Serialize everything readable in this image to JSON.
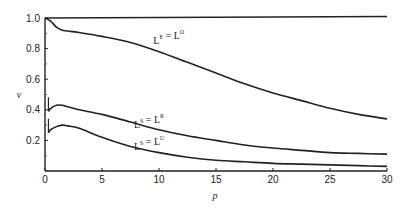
{
  "chart_data": {
    "type": "line",
    "title": "",
    "xlabel": "p",
    "ylabel": "v",
    "xlim": [
      0,
      30
    ],
    "ylim": [
      0,
      1.0
    ],
    "grid": false,
    "legend": "inline curve labels",
    "x_ticks": [
      0,
      5,
      10,
      15,
      20,
      25,
      30
    ],
    "x_tick_labels": [
      "0",
      "5",
      "10",
      "15",
      "20",
      "25",
      "30"
    ],
    "y_ticks": [
      0.2,
      0.4,
      0.6,
      0.8,
      1.0
    ],
    "y_tick_labels": [
      "0.2",
      "0.4",
      "0.6",
      "0.8",
      "1.0"
    ],
    "series": [
      {
        "name": "v = 1.0 (upper bound)",
        "label": "",
        "x": [
          0,
          30
        ],
        "values": [
          1.0,
          1.01
        ]
      },
      {
        "name": "L^E = L^O",
        "label": {
          "base1": "L",
          "sup1": "E",
          "eq": " = ",
          "base2": "L",
          "sup2": "O"
        },
        "label_at": [
          9.5,
          0.83
        ],
        "x": [
          0,
          0.5,
          1,
          1.5,
          2,
          3,
          5,
          7.5,
          10,
          12.5,
          15,
          17.5,
          20,
          22.5,
          25,
          27.5,
          30
        ],
        "values": [
          1.0,
          0.98,
          0.94,
          0.92,
          0.915,
          0.905,
          0.88,
          0.84,
          0.78,
          0.71,
          0.64,
          0.57,
          0.51,
          0.46,
          0.41,
          0.37,
          0.34
        ]
      },
      {
        "name": "L^S = L^R",
        "label": {
          "base1": "L",
          "sup1": "S",
          "eq": " = ",
          "base2": "L",
          "sup2": "R"
        },
        "label_at": [
          7.8,
          0.28
        ],
        "x": [
          0.3,
          0.5,
          1,
          1.5,
          2,
          3,
          5,
          7.5,
          10,
          12.5,
          15,
          17.5,
          20,
          22.5,
          25,
          27.5,
          30
        ],
        "values": [
          0.39,
          0.41,
          0.43,
          0.43,
          0.42,
          0.4,
          0.37,
          0.32,
          0.27,
          0.23,
          0.2,
          0.17,
          0.15,
          0.135,
          0.12,
          0.115,
          0.11
        ]
      },
      {
        "name": "L^S = L^U",
        "label": {
          "base1": "L",
          "sup1": "S",
          "eq": " = ",
          "base2": "L",
          "sup2": "U"
        },
        "label_at": [
          7.8,
          0.14
        ],
        "x": [
          0.3,
          0.5,
          1,
          1.5,
          2,
          3,
          5,
          7.5,
          10,
          12.5,
          15,
          17.5,
          20,
          22.5,
          25,
          27.5,
          30
        ],
        "values": [
          0.25,
          0.27,
          0.29,
          0.3,
          0.295,
          0.28,
          0.22,
          0.16,
          0.12,
          0.09,
          0.07,
          0.06,
          0.05,
          0.045,
          0.04,
          0.035,
          0.03
        ]
      }
    ]
  }
}
